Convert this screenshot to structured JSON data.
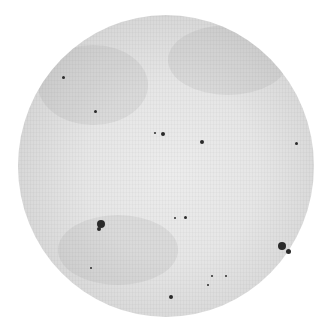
{
  "image": {
    "subject": "Solar disk with sunspots (monochrome photograph)",
    "background_color": "#ffffff",
    "disk_color_center": "#ececec",
    "disk_color_limb": "#a8a8a8",
    "spot_color": "#2a2a2a"
  },
  "sunspots": [
    {
      "x": 63,
      "y": 77,
      "r": 1.5
    },
    {
      "x": 95,
      "y": 111,
      "r": 1.5
    },
    {
      "x": 155,
      "y": 133,
      "r": 1.2
    },
    {
      "x": 163,
      "y": 134,
      "r": 2
    },
    {
      "x": 202,
      "y": 142,
      "r": 2
    },
    {
      "x": 296,
      "y": 143,
      "r": 1.5
    },
    {
      "x": 101,
      "y": 224,
      "r": 4
    },
    {
      "x": 99,
      "y": 229,
      "r": 2
    },
    {
      "x": 185,
      "y": 217,
      "r": 1.5
    },
    {
      "x": 175,
      "y": 218,
      "r": 1
    },
    {
      "x": 282,
      "y": 246,
      "r": 4
    },
    {
      "x": 288,
      "y": 251,
      "r": 2.5
    },
    {
      "x": 91,
      "y": 268,
      "r": 1
    },
    {
      "x": 208,
      "y": 285,
      "r": 1.2
    },
    {
      "x": 226,
      "y": 276,
      "r": 1
    },
    {
      "x": 212,
      "y": 276,
      "r": 1
    },
    {
      "x": 171,
      "y": 297,
      "r": 2
    }
  ]
}
